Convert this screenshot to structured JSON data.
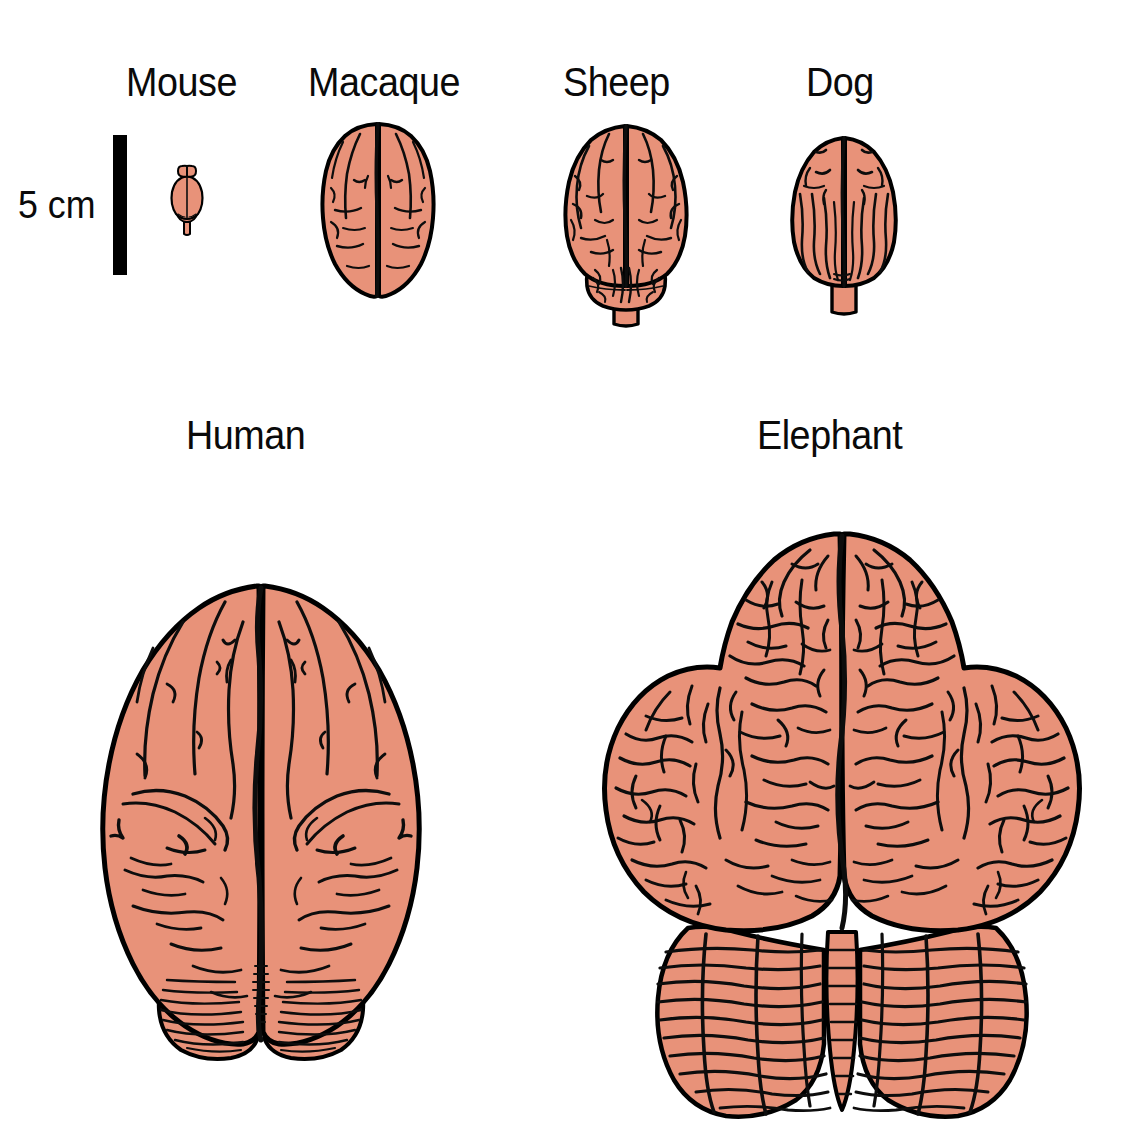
{
  "figure": {
    "background_color": "#ffffff",
    "brain_fill_color": "#e89279",
    "outline_color": "#000000",
    "view": "dorsal (top-down) view of whole brains drawn to a common scale"
  },
  "scale": {
    "label": "5 cm",
    "bar_color": "#000000",
    "orientation": "vertical",
    "bar_height_px": 140,
    "bar_width_px": 14
  },
  "rows": [
    {
      "row_name": "small-brains-row",
      "species": [
        "Mouse",
        "Macaque",
        "Sheep",
        "Dog"
      ]
    },
    {
      "row_name": "large-brains-row",
      "species": [
        "Human",
        "Elephant"
      ]
    }
  ],
  "specimens": [
    {
      "id": "mouse",
      "label": "Mouse",
      "label_x": 126,
      "label_y": 62,
      "brain_x": 163,
      "brain_y": 160,
      "brain_w": 48,
      "brain_h": 76,
      "relative_size": "smallest",
      "features": [
        "olfactory bulbs",
        "smooth lissencephalic cerebrum",
        "cerebellum",
        "brainstem"
      ]
    },
    {
      "id": "macaque",
      "label": "Macaque",
      "label_x": 308,
      "label_y": 62,
      "brain_x": 313,
      "brain_y": 118,
      "brain_w": 130,
      "brain_h": 182,
      "relative_size": "small",
      "features": [
        "gyrencephalic cerebrum",
        "central sulcus",
        "longitudinal fissure"
      ]
    },
    {
      "id": "sheep",
      "label": "Sheep",
      "label_x": 563,
      "label_y": 62,
      "brain_x": 551,
      "brain_y": 120,
      "brain_w": 148,
      "brain_h": 208,
      "relative_size": "medium",
      "features": [
        "gyrencephalic cerebrum",
        "exposed cerebellum",
        "brainstem"
      ]
    },
    {
      "id": "dog",
      "label": "Dog",
      "label_x": 806,
      "label_y": 62,
      "brain_x": 782,
      "brain_y": 132,
      "brain_w": 122,
      "brain_h": 182,
      "relative_size": "medium",
      "features": [
        "longitudinal gyri",
        "small cerebellum",
        "brainstem"
      ]
    },
    {
      "id": "human",
      "label": "Human",
      "label_x": 186,
      "label_y": 415,
      "brain_x": 75,
      "brain_y": 578,
      "brain_w": 370,
      "brain_h": 498,
      "relative_size": "large",
      "features": [
        "highly gyrencephalic cerebrum",
        "deep longitudinal fissure",
        "cerebellum with fine folia"
      ]
    },
    {
      "id": "elephant",
      "label": "Elephant",
      "label_x": 757,
      "label_y": 415,
      "brain_x": 596,
      "brain_y": 520,
      "brain_w": 490,
      "brain_h": 600,
      "relative_size": "largest",
      "features": [
        "very large convoluted temporal lobes",
        "dense cortical gyri",
        "massive foliated cerebellum"
      ]
    }
  ]
}
